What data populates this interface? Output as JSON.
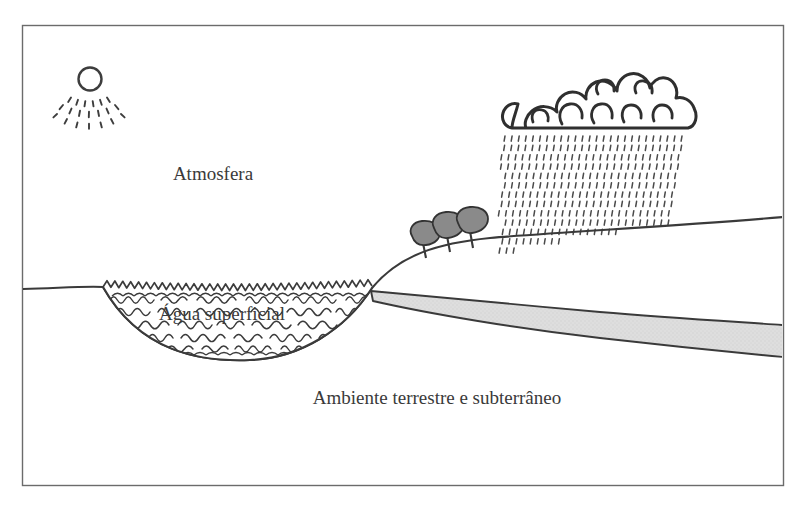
{
  "diagram": {
    "frame": {
      "border_color": "#6b6b6b",
      "border_width": 1.4,
      "x": 22,
      "y": 25,
      "width": 761,
      "height": 460
    },
    "labels": {
      "atmosphere": "Atmosfera",
      "surface_water": "Água superficial",
      "ground_environment": "Ambiente terrestre e subterrâneo"
    },
    "label_positions": {
      "atmosphere": {
        "x": 213,
        "y": 180,
        "font_size": 19
      },
      "surface_water": {
        "x": 222,
        "y": 320,
        "font_size": 19
      },
      "ground_environment": {
        "x": 437,
        "y": 404,
        "font_size": 19
      }
    },
    "elements": {
      "sun": {
        "name": "sun",
        "center_x": 90,
        "center_y": 79,
        "radius": 12,
        "ray_count": 13,
        "ray_rows": 3,
        "stroke": "#3d3d3d"
      },
      "cloud": {
        "name": "rain-cloud",
        "x": 508,
        "y": 72,
        "width": 186,
        "height": 56,
        "stroke": "#2f2f2f"
      },
      "rain": {
        "name": "rainfall",
        "left": 505,
        "right": 682,
        "top": 136,
        "bottom": 248,
        "rows": 13,
        "cols": 26,
        "dash_color": "#4a4a4a"
      },
      "trees": {
        "name": "trees",
        "count": 3,
        "canopy_fill": "#8a8a8a",
        "canopy_stroke": "#333333",
        "trunk_color": "#3a3a3a",
        "positions": [
          {
            "x": 423,
            "y": 241
          },
          {
            "x": 446,
            "y": 234
          },
          {
            "x": 469,
            "y": 230
          }
        ]
      },
      "lake": {
        "name": "surface-water-lake",
        "left": 103,
        "right": 372,
        "surface_y": 288,
        "bottom_y": 352,
        "wave_rows": 5,
        "wave_color": "#3c3c3c",
        "sawtooth_teeth": 34
      },
      "aquifer": {
        "name": "groundwater-aquifer",
        "fill": "#dcdcdc",
        "stroke": "#3a3a3a",
        "start_x": 371,
        "end_x": 783,
        "top_start_y": 291,
        "top_end_y": 325,
        "bottom_start_y": 300,
        "bottom_end_y": 357
      },
      "terrain": {
        "name": "terrain-profile",
        "stroke": "#3a3a3a",
        "stroke_width": 2.1,
        "left_flat_y": 289,
        "ridge_x": 372,
        "right_edge_y": 235
      }
    },
    "colors": {
      "ink": "#3a3a3a",
      "frame": "#6b6b6b",
      "tree_canopy": "#8a8a8a",
      "aquifer_fill": "#dcdcdc",
      "background": "#ffffff",
      "text": "#3a3a3a"
    }
  }
}
